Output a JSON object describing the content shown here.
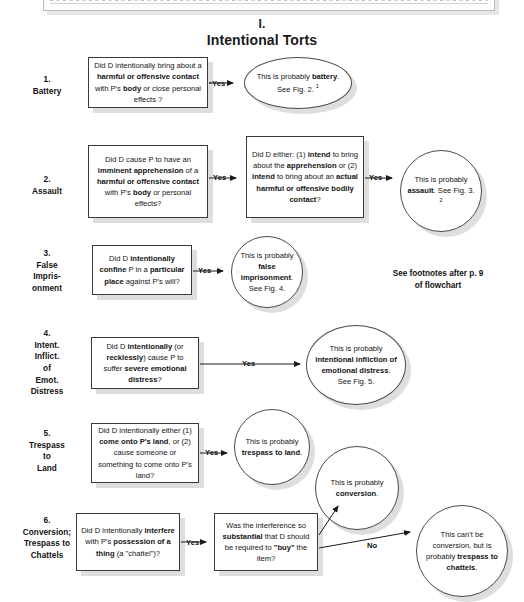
{
  "page": {
    "title_numeral": "I.",
    "title_name": "Intentional Torts",
    "top_artifact_note": "",
    "footnote_note_line1": "See footnotes after p. 9",
    "footnote_note_line2": "of flowchart"
  },
  "edge_labels": {
    "yes": "Yes",
    "no": "No"
  },
  "rows": [
    {
      "index": "1.",
      "label_lines": [
        "1.",
        "Battery"
      ],
      "question": "Did D intentionally bring about a harmful or offensive contact with P's body or close personal effects ?",
      "outcome": "This is probably battery. See Fig. 2."
    },
    {
      "index": "2.",
      "label_lines": [
        "2.",
        "Assault"
      ],
      "question": "Did D cause P to have an imminent apprehension of a harmful or offensive contact with P's body or personal effects?",
      "question2": "Did D either: (1) intend to bring about the apprehension or (2) intend to bring about an actual harmful or offensive bodily contact?",
      "outcome": "This is probably assault. See Fig. 3."
    },
    {
      "index": "3.",
      "label_lines": [
        "3.",
        "False",
        "Impris-",
        "onment"
      ],
      "question": "Did D intentionally confine P in a particular place against P's will?",
      "outcome": "This is probably false imprisonment. See Fig. 4."
    },
    {
      "index": "4.",
      "label_lines": [
        "4.",
        "Intent.",
        "Inflict.",
        "of",
        "Emot.",
        "Distress"
      ],
      "question": "Did D intentionally (or recklessly) cause P to suffer severe emotional distress?",
      "outcome": "This is probably intentional infliction of emotional distress. See Fig. 5."
    },
    {
      "index": "5.",
      "label_lines": [
        "5.",
        "Trespass",
        "to",
        "Land"
      ],
      "question": "Did D intentionally either (1) come onto P's land, or (2) cause someone or something to come onto P's land?",
      "outcome": "This is probably trespass to land."
    },
    {
      "index": "6.",
      "label_lines": [
        "6.",
        "Conversion;",
        "Trespass to",
        "Chattels"
      ],
      "question": "Did D intentionally interfere with P's possession of a thing (a \"chattel\")?",
      "question2": "Was the interference so substantial that D should be required to \"buy\" the item?",
      "outcome_yes": "This is probably conversion.",
      "outcome_no": "This can't be conversion, but is probably trespass to chattels."
    }
  ],
  "nodes": {
    "battery_question_html": "Did D intentionally bring about a <b>harmful or offensive contact</b> with P's <b>body</b> or close personal effects ?",
    "battery_outcome_html": "This is probably <b>battery</b>. See Fig. 2. <sup>1</sup>",
    "assault_question_html": "Did D cause P to have an <b>imminent apprehension</b> of a <b>harmful or offensive contact</b> with P's <b>body</b> or personal effects?",
    "assault_question2_html": "Did D either: (1) <b>intend</b> to bring about the <b>apprehension</b> or (2) <b>intend</b> to bring about an <b>actual harmful or offensive bodily contact</b>?",
    "assault_outcome_html": "This is probably <b>assault</b>. See Fig. 3. <sup>2</sup>",
    "false_imprisonment_question_html": "Did D <b>intentionally confine</b> P in a <b>particular place</b> against P's will?",
    "false_imprisonment_outcome_html": "This is probably <b>false imprisonment</b>. See Fig. 4.",
    "iied_question_html": "Did D <b>intentionally</b> (or <b>recklessly</b>) cause P to suffer <b>severe emotional distress</b>?",
    "iied_outcome_html": "This is probably <b>intentional infliction of emotional distress</b>. See Fig. 5.",
    "trespass_land_question_html": "Did D intentionally either (1) <b>come onto P's land</b>, or (2) cause someone or something to come onto P's land?",
    "trespass_land_outcome_html": "This is probably <b>trespass to land</b>.",
    "conversion_question_html": "Did D intentionally <b>interfere</b> with P's <b>possession of a thing</b> (a \"chattel\")?",
    "conversion_question2_html": "Was the interference so <b>substantial</b> that D should be required to <b>\"buy\"</b> the item?",
    "conversion_outcome_html": "This is probably <b>conversion</b>.",
    "chattels_outcome_html": "This can't be conversion, but is probably <b>trespass to chattels</b>."
  },
  "colors": {
    "ink": "#141414",
    "stroke": "#3a3a3a",
    "shadow": "rgba(0,0,0,0.13)",
    "paper": "#ffffff"
  }
}
